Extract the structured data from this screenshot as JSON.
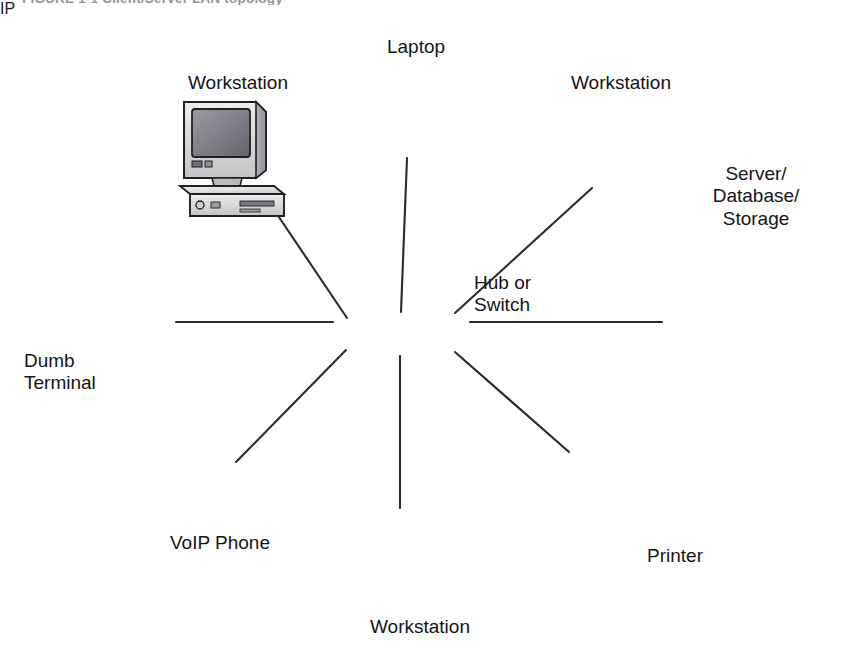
{
  "figure": {
    "caption": "FIGURE 1-1   Client/Server LAN topology",
    "background_color": "#ffffff",
    "ink_color": "#14141a"
  },
  "diagram": {
    "type": "network-topology",
    "topology": "star",
    "center_device": "hub-switch",
    "center_label": "Hub or\nSwitch",
    "center_label_lines": [
      "Hub or",
      "Switch"
    ],
    "palette": {
      "outline": "#1f1f24",
      "screen_dark": "#5e5e66",
      "screen_mid": "#8d8d95",
      "body_light": "#e2e2e2",
      "body_mid": "#c2c2c4",
      "body_dark": "#9a9a9e",
      "paper_white": "#fbfbfb"
    },
    "nodes": [
      {
        "id": "workstation-top-left",
        "label": "Workstation",
        "label_lines": [
          "Workstation"
        ],
        "icon": "desktop-computer-icon",
        "label_x": 168,
        "label_y": 72,
        "label_w": 140,
        "align": "center"
      },
      {
        "id": "laptop-top",
        "label": "Laptop",
        "label_lines": [
          "Laptop"
        ],
        "icon": "laptop-icon",
        "label_x": 356,
        "label_y": 36,
        "label_w": 120,
        "align": "center"
      },
      {
        "id": "workstation-top-right",
        "label": "Workstation",
        "label_lines": [
          "Workstation"
        ],
        "icon": "desktop-computer-icon",
        "label_x": 551,
        "label_y": 72,
        "label_w": 140,
        "align": "center"
      },
      {
        "id": "server-database-storage",
        "label": "Server/\nDatabase/\nStorage",
        "label_lines": [
          "Server/",
          "Database/",
          "Storage"
        ],
        "icon": "server-database-icon",
        "label_x": 690,
        "label_y": 163,
        "label_w": 132,
        "align": "center"
      },
      {
        "id": "dumb-terminal",
        "label": "Dumb\nTerminal",
        "label_lines": [
          "Dumb",
          "Terminal"
        ],
        "icon": "flat-monitor-keyboard-icon",
        "label_x": 24,
        "label_y": 350,
        "label_w": 120,
        "align": "left"
      },
      {
        "id": "voip-phone",
        "label": "VoIP Phone",
        "label_lines": [
          "VoIP Phone"
        ],
        "icon": "ip-desk-phone-icon",
        "label_x": 140,
        "label_y": 532,
        "label_w": 160,
        "align": "center"
      },
      {
        "id": "workstation-bottom",
        "label": "Workstation",
        "label_lines": [
          "Workstation"
        ],
        "icon": "desktop-computer-icon",
        "label_x": 350,
        "label_y": 616,
        "label_w": 140,
        "align": "center"
      },
      {
        "id": "printer",
        "label": "Printer",
        "label_lines": [
          "Printer"
        ],
        "icon": "printer-icon",
        "label_x": 620,
        "label_y": 545,
        "label_w": 110,
        "align": "center"
      }
    ],
    "links": [
      {
        "from": "workstation-top-left",
        "to": "hub-switch",
        "x1": 258,
        "y1": 186,
        "x2": 347,
        "y2": 318
      },
      {
        "from": "laptop-top",
        "to": "hub-switch",
        "x1": 407,
        "y1": 158,
        "x2": 400,
        "y2": 316
      },
      {
        "from": "workstation-top-right",
        "to": "hub-switch",
        "x1": 592,
        "y1": 188,
        "x2": 452,
        "y2": 315
      },
      {
        "from": "server-database-storage",
        "to": "hub-switch",
        "x1": 660,
        "y1": 322,
        "x2": 470,
        "y2": 322
      },
      {
        "from": "dumb-terminal",
        "to": "hub-switch",
        "x1": 176,
        "y1": 322,
        "x2": 333,
        "y2": 322
      },
      {
        "from": "voip-phone",
        "to": "hub-switch",
        "x1": 236,
        "y1": 462,
        "x2": 345,
        "y2": 348
      },
      {
        "from": "workstation-bottom",
        "to": "hub-switch",
        "x1": 400,
        "y1": 506,
        "x2": 400,
        "y2": 352
      },
      {
        "from": "printer",
        "to": "hub-switch",
        "x1": 569,
        "y1": 450,
        "x2": 452,
        "y2": 348
      }
    ]
  }
}
